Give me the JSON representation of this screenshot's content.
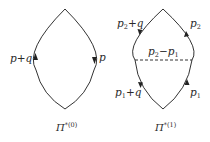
{
  "diagrams": [
    {
      "id": "pi0",
      "caption": {
        "symbol": "Π",
        "superscript": "*(0)"
      },
      "lines": [
        {
          "side": "left",
          "label": "p+q",
          "arrow": "up"
        },
        {
          "side": "right",
          "label": "p",
          "arrow": "down"
        }
      ],
      "interaction_line": null
    },
    {
      "id": "pi1",
      "caption": {
        "symbol": "Π",
        "superscript": "*(1)"
      },
      "lines": [
        {
          "side": "upper-left",
          "label_base": "p",
          "label_sub": "2",
          "label_tail": "+q",
          "arrow": "down"
        },
        {
          "side": "upper-right",
          "label_base": "p",
          "label_sub": "2",
          "label_tail": "",
          "arrow": "up"
        },
        {
          "side": "lower-left",
          "label_base": "p",
          "label_sub": "1",
          "label_tail": "+q",
          "arrow": "down"
        },
        {
          "side": "lower-right",
          "label_base": "p",
          "label_sub": "1",
          "label_tail": "",
          "arrow": "up"
        }
      ],
      "interaction_line": {
        "style": "dashed",
        "label": {
          "a": "p",
          "a_sub": "2",
          "op": "−",
          "b": "p",
          "b_sub": "1"
        }
      }
    }
  ],
  "colors": {
    "line": "#333333",
    "text": "#2a2a2a",
    "background": "#ffffff"
  }
}
